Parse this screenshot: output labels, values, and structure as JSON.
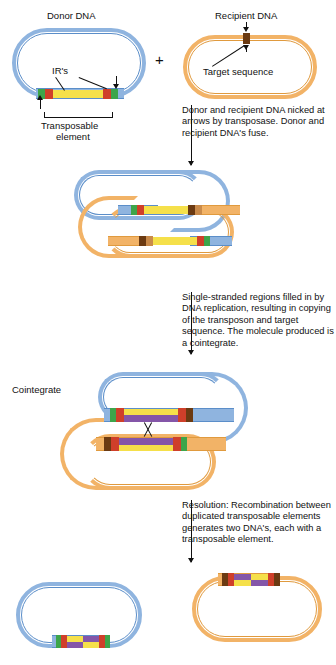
{
  "figure": {
    "type": "biology-process-diagram"
  },
  "labels": {
    "donor_dna": "Donor DNA",
    "recipient_dna": "Recipient DNA",
    "plus": "+",
    "irs": "IR's",
    "target_sequence": "Target sequence",
    "transposable_element_line1": "Transposable",
    "transposable_element_line2": "element",
    "cointegrate": "Cointegrate"
  },
  "captions": {
    "step1": "Donor and recipient DNA nicked at arrows by transposase. Donor and recipient DNA's fuse.",
    "step2": "Single-stranded regions filled in by DNA replication, resulting in copying of the transposon and target sequence. The molecule produced is a cointegrate.",
    "step3": "Resolution: Recombination between duplicated transposable elements generates two DNA's, each with a transposable element."
  },
  "colors": {
    "donor_backbone": "#8fb4df",
    "donor_backbone_line": "#5b8ec9",
    "recipient_backbone": "#f2b367",
    "recipient_backbone_line": "#e09a3e",
    "inverted_repeat_green": "#3da54a",
    "inverted_repeat_red": "#cf3f2a",
    "target_sequence_brown": "#6b3a12",
    "transposon_yellow": "#f5e04a",
    "replicated_strand_purple": "#8456a8"
  },
  "stages": [
    {
      "name": "stage-1-separate-plasmids",
      "elements": [
        "donor plasmid (blue) with transposable element",
        "recipient plasmid (orange) with target sequence"
      ]
    },
    {
      "name": "stage-2-fused-intermediate",
      "elements": [
        "blue and orange strands joined at nicked transposon ends"
      ]
    },
    {
      "name": "stage-3-cointegrate",
      "elements": [
        "duplicated transposable elements",
        "crossover X between repeats"
      ]
    },
    {
      "name": "stage-4-resolved-products",
      "elements": [
        "donor plasmid with transposable element",
        "recipient plasmid with transposable element"
      ]
    }
  ]
}
